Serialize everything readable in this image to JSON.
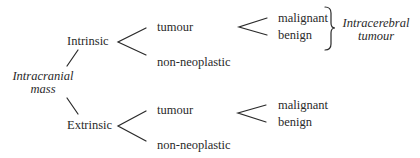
{
  "diagram": {
    "root": {
      "label_line1": "Intracranial",
      "label_line2": "mass"
    },
    "intrinsic": {
      "label": "Intrinsic",
      "tumour": "tumour",
      "non_neoplastic": "non-neoplastic",
      "malignant": "malignant",
      "benign": "benign",
      "group_label_line1": "Intracerebral",
      "group_label_line2": "tumour"
    },
    "extrinsic": {
      "label": "Extrinsic",
      "tumour": "tumour",
      "non_neoplastic": "non-neoplastic",
      "malignant": "malignant",
      "benign": "benign"
    },
    "colors": {
      "text": "#2a2a2a",
      "line": "#2a2a2a",
      "background": "#ffffff"
    }
  }
}
